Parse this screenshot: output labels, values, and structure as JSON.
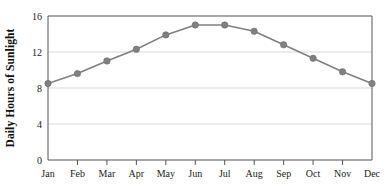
{
  "chart_data": {
    "type": "line",
    "title": "",
    "subtitle": "",
    "xlabel": "",
    "ylabel": "Daily Hours of Sunlight",
    "categories": [
      "Jan",
      "Feb",
      "Mar",
      "Apr",
      "May",
      "Jun",
      "Jul",
      "Aug",
      "Sep",
      "Oct",
      "Nov",
      "Dec"
    ],
    "values": [
      8.5,
      9.6,
      11.0,
      12.3,
      13.9,
      15.0,
      15.0,
      14.3,
      12.8,
      11.3,
      9.8,
      8.5
    ],
    "series": [
      {
        "name": "Daily Hours of Sunlight",
        "values": [
          8.5,
          9.6,
          11.0,
          12.3,
          13.9,
          15.0,
          15.0,
          14.3,
          12.8,
          11.3,
          9.8,
          8.5
        ]
      }
    ],
    "ylim": [
      0,
      16
    ],
    "yticks": [
      0,
      4,
      8,
      12,
      16
    ],
    "ytick_labels": [
      "0",
      "4",
      "8",
      "12",
      "16"
    ],
    "xtick_labels": [
      "Jan",
      "Feb",
      "Mar",
      "Apr",
      "May",
      "Jun",
      "Jul",
      "Aug",
      "Sep",
      "Oct",
      "Nov",
      "Dec"
    ],
    "grid": true,
    "grid_axis": "y",
    "legend": false,
    "legend_position": "none",
    "marker": "circle",
    "line_color": "#808080",
    "marker_color": "#808080",
    "grid_color": "#d9d9d9",
    "axis_color": "#555555",
    "background_color": "#ffffff"
  },
  "axes": {
    "y_title": "Daily Hours of Sunlight"
  }
}
